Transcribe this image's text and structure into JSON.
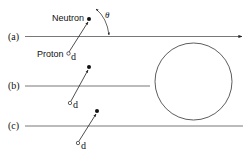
{
  "diagram": {
    "panels": [
      {
        "label": "(a)",
        "neutron_label": "Neutron",
        "proton_label": "Proton",
        "d_label": "d",
        "angle_label": "θ"
      },
      {
        "label": "(b)",
        "d_label": "d"
      },
      {
        "label": "(c)",
        "d_label": "d"
      }
    ],
    "colors": {
      "line": "#555555",
      "ink": "#111111",
      "background": "#ffffff"
    }
  }
}
